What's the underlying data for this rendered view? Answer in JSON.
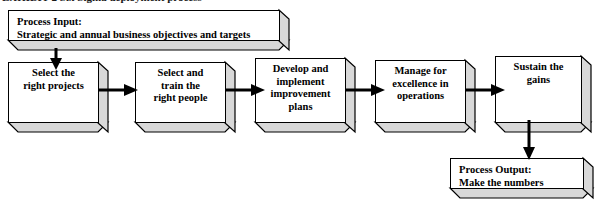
{
  "page": {
    "width": 599,
    "height": 201,
    "background": "#ffffff",
    "ink": "#000000",
    "face_fill": "#d8d8d8",
    "front_fill": "#ffffff",
    "cropped_caption": "EXHIBIT 2   Six Sigma deployment process"
  },
  "input_box": {
    "name": "process-input",
    "line1": "Process Input:",
    "line2": "Strategic and annual business objectives and targets"
  },
  "steps": [
    {
      "name": "select-the-right-projects",
      "lines": [
        "Select the",
        "right projects"
      ]
    },
    {
      "name": "select-and-train-the-right-people",
      "lines": [
        "Select and",
        "train the",
        "right people"
      ]
    },
    {
      "name": "develop-and-implement-improvement-plans",
      "lines": [
        "Develop and",
        "implement",
        "improvement",
        "plans"
      ]
    },
    {
      "name": "manage-for-excellence-in-operations",
      "lines": [
        "Manage for",
        "excellence in",
        "operations"
      ]
    },
    {
      "name": "sustain-the-gains",
      "lines": [
        "Sustain the",
        "gains"
      ]
    }
  ],
  "output_box": {
    "name": "process-output",
    "line1": "Process Output:",
    "line2": "Make the numbers"
  },
  "connectors": [
    {
      "name": "arrow-input-to-step-1",
      "direction": "down"
    },
    {
      "name": "arrow-step-1-to-step-2",
      "direction": "right"
    },
    {
      "name": "arrow-step-2-to-step-3",
      "direction": "right"
    },
    {
      "name": "arrow-step-3-to-step-4",
      "direction": "right"
    },
    {
      "name": "arrow-step-4-to-step-5",
      "direction": "right"
    },
    {
      "name": "arrow-step-5-to-output",
      "direction": "down"
    }
  ]
}
